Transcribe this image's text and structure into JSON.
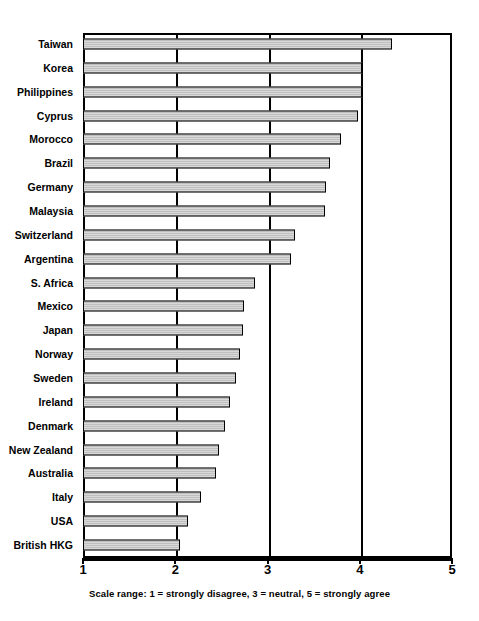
{
  "caption": "Scale range: 1 = strongly disagree, 3 = neutral, 5 = strongly agree",
  "axis": {
    "tick_labels": [
      "1",
      "2",
      "3",
      "4",
      "5"
    ]
  },
  "chart_data": {
    "type": "bar",
    "orientation": "horizontal",
    "title": "",
    "subtitle": "",
    "xlabel": "Scale range: 1 = strongly disagree, 3 = neutral, 5 = strongly agree",
    "ylabel": "",
    "xlim": [
      1,
      5
    ],
    "xticks": [
      1,
      2,
      3,
      4,
      5
    ],
    "grid": "vertical gridlines at 2, 3, 4",
    "legend": "none",
    "bar_color": "#c9c9c9",
    "bar_edge_color": "#000000",
    "categories": [
      "Taiwan",
      "Korea",
      "Philippines",
      "Cyprus",
      "Morocco",
      "Brazil",
      "Germany",
      "Malaysia",
      "Switzerland",
      "Argentina",
      "S. Africa",
      "Mexico",
      "Japan",
      "Norway",
      "Sweden",
      "Ireland",
      "Denmark",
      "New Zealand",
      "Australia",
      "Italy",
      "USA",
      "British HKG"
    ],
    "values": [
      4.35,
      4.02,
      4.02,
      3.98,
      3.8,
      3.68,
      3.63,
      3.62,
      3.3,
      3.26,
      2.86,
      2.74,
      2.73,
      2.7,
      2.66,
      2.59,
      2.54,
      2.47,
      2.44,
      2.28,
      2.14,
      2.05
    ]
  }
}
